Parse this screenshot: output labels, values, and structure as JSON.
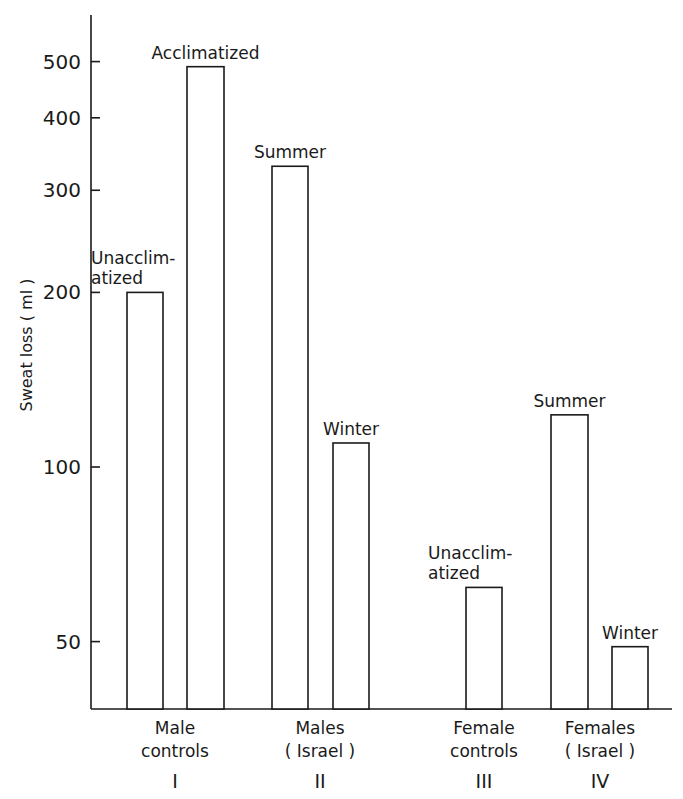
{
  "chart_data": {
    "type": "bar",
    "title": "",
    "xlabel": "",
    "ylabel": "Sweat loss ( ml )",
    "yscale": "log",
    "ylim": [
      35,
      600
    ],
    "yticks": [
      50,
      100,
      200,
      300,
      400,
      500
    ],
    "ytick_labels": [
      "50",
      "100",
      "200",
      "300",
      "400",
      "500"
    ],
    "grid": false,
    "legend": null,
    "groups": [
      {
        "label_lines": [
          "Male",
          "controls"
        ],
        "numeral": "I",
        "bars": [
          {
            "label_lines": [
              "Unacclim-",
              "atized"
            ],
            "value": 200
          },
          {
            "label_lines": [
              "Acclimatized"
            ],
            "value": 490
          }
        ]
      },
      {
        "label_lines": [
          "Males",
          "( Israel )"
        ],
        "numeral": "II",
        "bars": [
          {
            "label_lines": [
              "Summer"
            ],
            "value": 330
          },
          {
            "label_lines": [
              "Winter"
            ],
            "value": 110
          }
        ]
      },
      {
        "label_lines": [
          "Female",
          "controls"
        ],
        "numeral": "III",
        "bars": [
          {
            "label_lines": [
              "Unacclim-",
              "atized"
            ],
            "value": 62
          }
        ]
      },
      {
        "label_lines": [
          "Females",
          "( Israel )"
        ],
        "numeral": "IV",
        "bars": [
          {
            "label_lines": [
              "Summer"
            ],
            "value": 123
          },
          {
            "label_lines": [
              "Winter"
            ],
            "value": 49
          }
        ]
      }
    ],
    "categories": [
      "Male controls - Unacclimatized",
      "Male controls - Acclimatized",
      "Males (Israel) - Summer",
      "Males (Israel) - Winter",
      "Female controls - Unacclimatized",
      "Females (Israel) - Summer",
      "Females (Israel) - Winter"
    ],
    "values": [
      200,
      490,
      330,
      110,
      62,
      123,
      49
    ]
  },
  "layout": {
    "axis_x": 91,
    "axis_top": 15,
    "baseline_y": 709,
    "right_end": 672,
    "y_ref_value": 100,
    "y_ref_px": 467,
    "px_per_decade": 580,
    "bar_x": [
      [
        127,
        163
      ],
      [
        187,
        224
      ],
      [
        272,
        308
      ],
      [
        333,
        369
      ],
      [
        466,
        502
      ],
      [
        551,
        588
      ],
      [
        612,
        648
      ]
    ],
    "group_centers": [
      175,
      320,
      484,
      600
    ]
  }
}
